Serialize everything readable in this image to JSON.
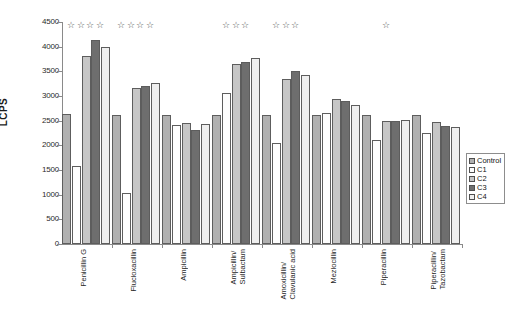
{
  "chart_data": {
    "type": "bar",
    "title": "",
    "xlabel": "",
    "ylabel": "LCPS",
    "ylim": [
      0,
      4500
    ],
    "ytick_step": 500,
    "yticks": [
      "4500",
      "4000",
      "3500",
      "3000",
      "2500",
      "2000",
      "1500",
      "1000",
      "500",
      "0"
    ],
    "grid": false,
    "legend_position": "right",
    "categories": [
      "Penicillin G",
      "Flucloxacillin",
      "Ampicillin",
      "Ampicillin/\nSulbactam",
      "Amoxicillin/\nClavulanic acid",
      "Mezlocillin",
      "Piperacillin",
      "Piperacillin/\nTazobactam"
    ],
    "series": [
      {
        "name": "Control",
        "color": "#b0b0b0",
        "values": [
          2630,
          2620,
          2620,
          2610,
          2620,
          2620,
          2620,
          2620
        ]
      },
      {
        "name": "C1",
        "color": "#fdfdfd",
        "values": [
          1590,
          1040,
          2410,
          3060,
          2050,
          2660,
          2100,
          2260
        ]
      },
      {
        "name": "C2",
        "color": "#c6c6c6",
        "values": [
          3820,
          3170,
          2460,
          3650,
          3340,
          2930,
          2490,
          2470
        ]
      },
      {
        "name": "C3",
        "color": "#6e6e6e",
        "values": [
          4140,
          3200,
          2310,
          3690,
          3500,
          2900,
          2500,
          2400
        ]
      },
      {
        "name": "C4",
        "color": "#efefef",
        "values": [
          4000,
          3260,
          2440,
          3770,
          3430,
          2810,
          2520,
          2370
        ]
      }
    ],
    "annotations": {
      "symbol": "☆",
      "star_counts": [
        4,
        4,
        0,
        3,
        3,
        0,
        1,
        0
      ]
    }
  },
  "legend": {
    "items": [
      {
        "label": "Control"
      },
      {
        "label": "C1"
      },
      {
        "label": "C2"
      },
      {
        "label": "C3"
      },
      {
        "label": "C4"
      }
    ]
  }
}
